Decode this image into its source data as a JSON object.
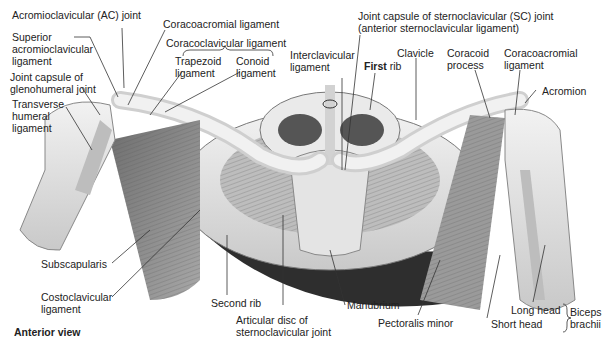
{
  "figure": {
    "caption": "Anterior view",
    "labels": {
      "ac_joint": "Acromioclavicular (AC) joint",
      "superior_ac_ligament": [
        "Superior",
        "acromioclavicular",
        "ligament"
      ],
      "joint_capsule_glenohumeral": [
        "Joint capsule of",
        "glenohumeral joint"
      ],
      "transverse_humeral": [
        "Transverse",
        "humeral",
        "ligament"
      ],
      "coracoacromial_left": "Coracoacromial ligament",
      "coracoclavicular": "Coracoclavicular ligament",
      "trapezoid": [
        "Trapezoid",
        "ligament"
      ],
      "conoid": [
        "Conoid",
        "ligament"
      ],
      "interclavicular": [
        "Interclavicular",
        "ligament"
      ],
      "sc_joint_capsule": [
        "Joint capsule of sternoclavicular (SC) joint",
        "(anterior sternoclavicular ligament)"
      ],
      "first_rib_bold": "First",
      "first_rib_rest": " rib",
      "clavicle": "Clavicle",
      "coracoid_process": [
        "Coracoid",
        "process"
      ],
      "coracoacromial_right": [
        "Coracoacromial",
        "ligament"
      ],
      "acromion": "Acromion",
      "subscapularis": "Subscapularis",
      "costoclavicular": [
        "Costoclavicular",
        "ligament"
      ],
      "second_rib": "Second rib",
      "articular_disc": [
        "Articular disc of",
        "sternoclavicular joint"
      ],
      "manubrium": "Manubrium",
      "pectoralis_minor": "Pectoralis minor",
      "long_head": "Long head",
      "short_head": "Short head",
      "biceps_brachii": [
        "Biceps",
        "brachii"
      ]
    },
    "colors": {
      "bone": "#e6e6e6",
      "muscle": "#8a8a8a",
      "shadow": "#3a3a3a",
      "leader": "#333333"
    }
  }
}
